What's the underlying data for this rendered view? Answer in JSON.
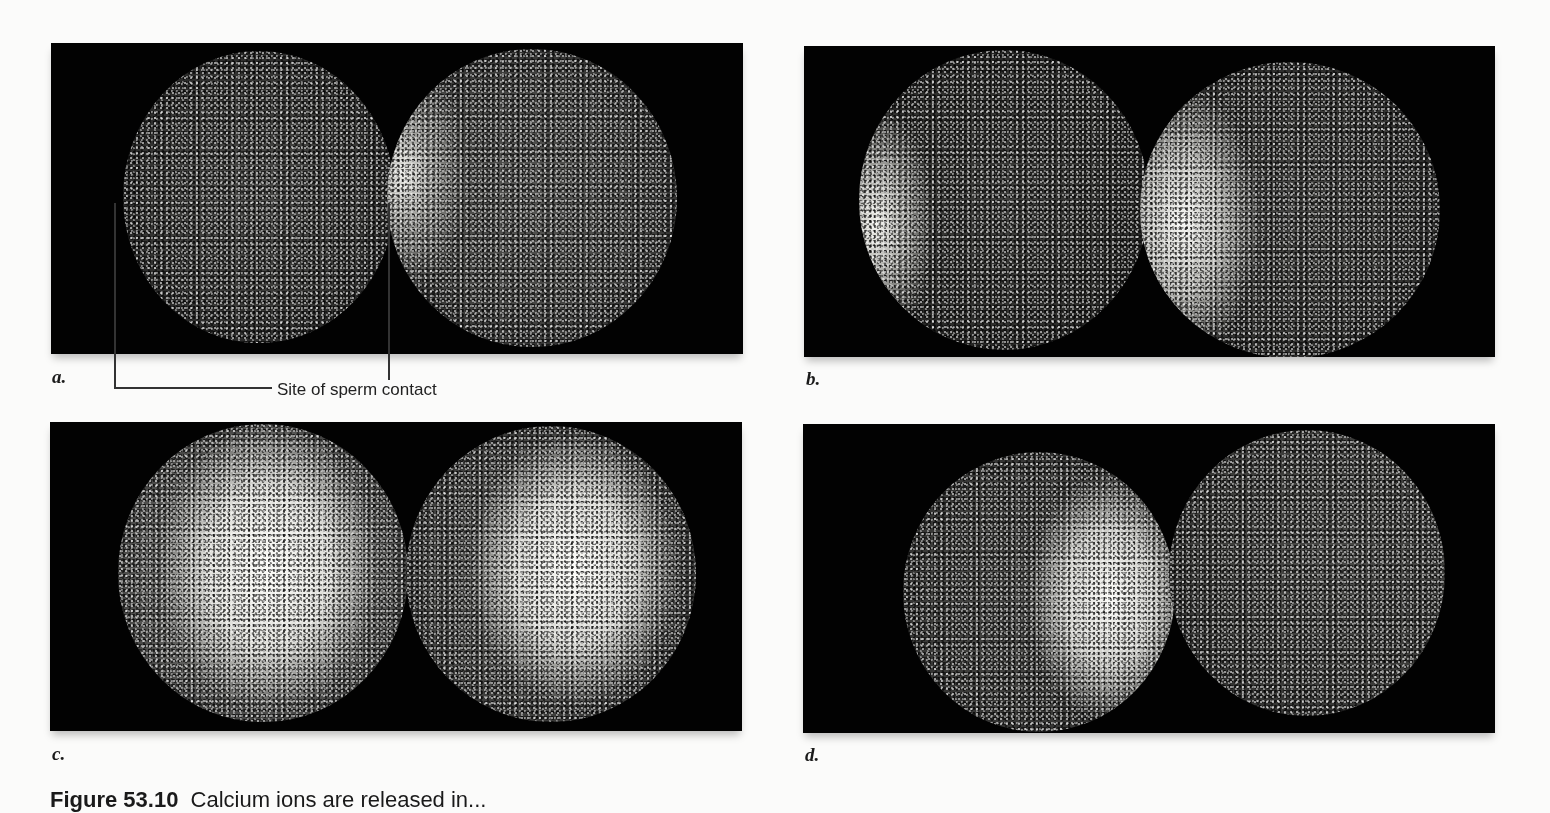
{
  "figure": {
    "panels": [
      {
        "id": "a",
        "label": "a.",
        "description": "Two eggs; faint calcium fluorescence beginning at site of sperm contact on right egg"
      },
      {
        "id": "b",
        "label": "b.",
        "description": "Calcium wave spreading from left edge of both eggs"
      },
      {
        "id": "c",
        "label": "c.",
        "description": "Bright calcium wave across majority of both eggs"
      },
      {
        "id": "d",
        "label": "d.",
        "description": "Calcium wave passing toward opposite side; left egg bright on right side"
      }
    ],
    "annotation": {
      "text": "Site of sperm contact",
      "panel": "a"
    },
    "caption": {
      "figure_number": "Figure 53.10",
      "text": "Calcium ions are released in..."
    }
  },
  "colors": {
    "panel_background": "#020202",
    "page_background": "#fbfbfa",
    "fluorescence": "#f4f4f0",
    "text": "#1a1a1a"
  }
}
